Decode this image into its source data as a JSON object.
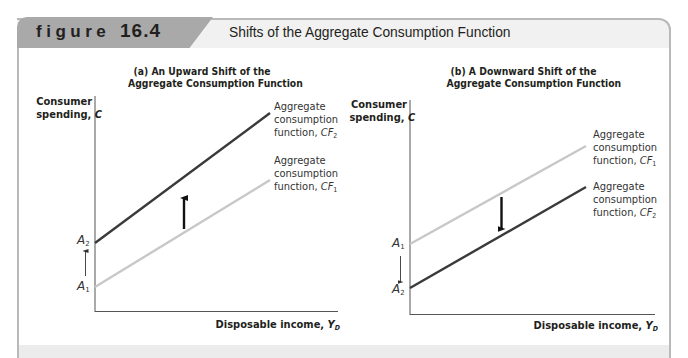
{
  "header": {
    "figure_word": "figure",
    "figure_number": "16.4",
    "title": "Shifts of the Aggregate Consumption Function"
  },
  "colors": {
    "tab": "#a9a9a9",
    "header_bar": "#f1f1f1",
    "frame_border": "#b9b9b9",
    "dark_line": "#3a3a3a",
    "light_line": "#c8c8c8",
    "text": "#231f20"
  },
  "panels": [
    {
      "subtitle_line1": "(a) An Upward Shift of the",
      "subtitle_line2": "Aggregate Consumption Function",
      "ylabel_line1": "Consumer",
      "ylabel_line2": "spending,",
      "ylabel_var": "C",
      "xlabel": "Disposable income,",
      "xlabel_var": "Y",
      "xlabel_sub": "D",
      "upper_point": "A",
      "upper_point_sub": "2",
      "lower_point": "A",
      "lower_point_sub": "1",
      "upper_curve": {
        "line1": "Aggregate",
        "line2": "consumption",
        "line3": "function,",
        "var": "CF",
        "sub": "2"
      },
      "lower_curve": {
        "line1": "Aggregate",
        "line2": "consumption",
        "line3": "function,",
        "var": "CF",
        "sub": "1"
      },
      "shift_direction": "up"
    },
    {
      "subtitle_line1": "(b) A Downward Shift of the",
      "subtitle_line2": "Aggregate Consumption Function",
      "ylabel_line1": "Consumer",
      "ylabel_line2": "spending,",
      "ylabel_var": "C",
      "xlabel": "Disposable income,",
      "xlabel_var": "Y",
      "xlabel_sub": "D",
      "upper_point": "A",
      "upper_point_sub": "1",
      "lower_point": "A",
      "lower_point_sub": "2",
      "upper_curve": {
        "line1": "Aggregate",
        "line2": "consumption",
        "line3": "function,",
        "var": "CF",
        "sub": "1"
      },
      "lower_curve": {
        "line1": "Aggregate",
        "line2": "consumption",
        "line3": "function,",
        "var": "CF",
        "sub": "2"
      },
      "shift_direction": "down"
    }
  ]
}
